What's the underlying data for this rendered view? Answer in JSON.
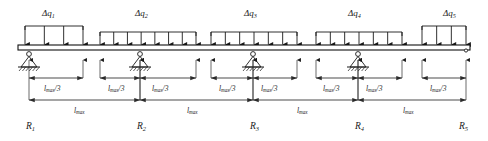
{
  "diagram": {
    "beam": {
      "x_start": 18,
      "x_end": 470,
      "y_top": 45,
      "y_bottom": 50,
      "color": "#111111"
    },
    "colors": {
      "line": "#1a1a1a",
      "beam": "#111111",
      "hatch": "#333333",
      "dim": "#2b2b2b",
      "background": "#ffffff"
    },
    "loads": [
      {
        "id": "q1",
        "label_base": "Δq",
        "label_sub": "1",
        "label_x": 42,
        "label_y": 8,
        "x1": 25,
        "x2": 83,
        "arrows": 4,
        "top_y": 26,
        "kind": "patch-end-left"
      },
      {
        "id": "q2",
        "label_base": "Δq",
        "label_sub": "2",
        "label_x": 135,
        "label_y": 8,
        "x1": 100,
        "x2": 196,
        "arrows": 8,
        "top_y": 32,
        "kind": "patch-interior"
      },
      {
        "id": "q3",
        "label_base": "Δq",
        "label_sub": "3",
        "label_x": 244,
        "label_y": 8,
        "x1": 211,
        "x2": 297,
        "arrows": 7,
        "top_y": 32,
        "kind": "patch-interior"
      },
      {
        "id": "q4",
        "label_base": "Δq",
        "label_sub": "4",
        "label_x": 348,
        "label_y": 8,
        "x1": 316,
        "x2": 402,
        "arrows": 7,
        "top_y": 32,
        "kind": "patch-interior"
      },
      {
        "id": "q5",
        "label_base": "Δq",
        "label_sub": "5",
        "label_x": 443,
        "label_y": 8,
        "x1": 422,
        "x2": 466,
        "arrows": 4,
        "top_y": 26,
        "kind": "patch-end-right"
      }
    ],
    "supports": [
      {
        "id": "s1",
        "x": 29,
        "type": "pinned-hatched",
        "reaction": {
          "base": "R",
          "sub": "1",
          "x": 26,
          "y": 121
        }
      },
      {
        "id": "s2",
        "x": 140,
        "type": "pinned-hatched",
        "reaction": {
          "base": "R",
          "sub": "2",
          "x": 137,
          "y": 121
        }
      },
      {
        "id": "s3",
        "x": 253,
        "type": "pinned-hatched",
        "reaction": {
          "base": "R",
          "sub": "3",
          "x": 250,
          "y": 121
        }
      },
      {
        "id": "s4",
        "x": 358,
        "type": "pinned-hatched",
        "reaction": {
          "base": "R",
          "sub": "4",
          "x": 355,
          "y": 121
        }
      },
      {
        "id": "s5",
        "x": 466,
        "type": "end-node",
        "reaction": {
          "base": "R",
          "sub": "5",
          "x": 459,
          "y": 121
        }
      }
    ],
    "dimensions": {
      "third_label": {
        "base": "l",
        "sub": "max",
        "suffix": "/3"
      },
      "span_label": {
        "base": "l",
        "sub": "max"
      },
      "thirds_row_y": 78,
      "spans_row_y": 100,
      "thirds": [
        {
          "x1": 29,
          "x2": 83,
          "label_x": 44,
          "label_y": 84
        },
        {
          "x1": 100,
          "x2": 140,
          "label_x": 108,
          "label_y": 84
        },
        {
          "x1": 140,
          "x2": 196,
          "label_x": 152,
          "label_y": 84
        },
        {
          "x1": 211,
          "x2": 253,
          "label_x": 219,
          "label_y": 84
        },
        {
          "x1": 253,
          "x2": 297,
          "label_x": 261,
          "label_y": 84
        },
        {
          "x1": 316,
          "x2": 358,
          "label_x": 323,
          "label_y": 84
        },
        {
          "x1": 358,
          "x2": 402,
          "label_x": 366,
          "label_y": 84
        },
        {
          "x1": 422,
          "x2": 466,
          "label_x": 430,
          "label_y": 84
        }
      ],
      "spans": [
        {
          "x1": 29,
          "x2": 140,
          "label_x": 74,
          "label_y": 106
        },
        {
          "x1": 140,
          "x2": 253,
          "label_x": 187,
          "label_y": 106
        },
        {
          "x1": 253,
          "x2": 358,
          "label_x": 297,
          "label_y": 106
        },
        {
          "x1": 358,
          "x2": 466,
          "label_x": 403,
          "label_y": 106
        }
      ]
    }
  }
}
